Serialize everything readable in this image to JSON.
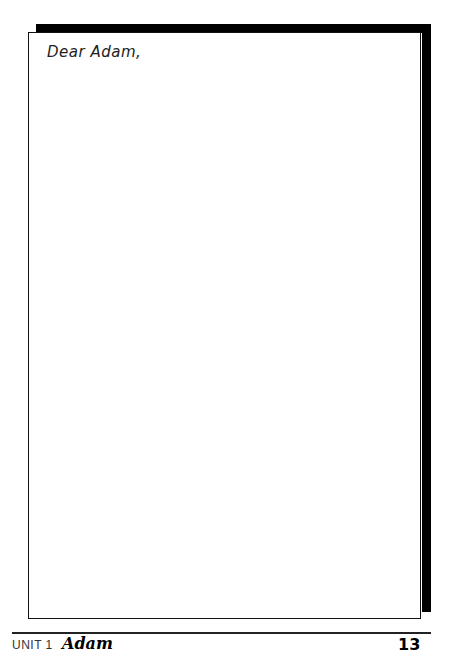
{
  "letter": {
    "salutation": "Dear Adam,"
  },
  "footer": {
    "unit_label": "UNIT 1",
    "unit_title": "Adam",
    "page_number": "13"
  }
}
